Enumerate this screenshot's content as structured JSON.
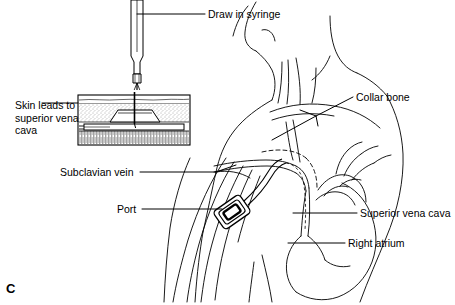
{
  "figure": {
    "panel_label": "C",
    "background_color": "#ffffff",
    "line_color": "#000000"
  },
  "labels": [
    {
      "name": "draw-in-syringe",
      "text": "Draw in syringe",
      "x": 208,
      "y": 8
    },
    {
      "name": "collar-bone",
      "text": "Collar bone",
      "x": 356,
      "y": 91
    },
    {
      "name": "superior-vena-cava",
      "text": "Superior vena cava",
      "x": 360,
      "y": 207
    },
    {
      "name": "right-atrium",
      "text": "Right atrium",
      "x": 348,
      "y": 237
    },
    {
      "name": "subclavian-vein",
      "text": "Subclavian vein",
      "x": 60,
      "y": 166
    },
    {
      "name": "port",
      "text": "Port",
      "x": 117,
      "y": 203
    },
    {
      "name": "skin-leads-to-svc",
      "text": "Skin leads to superior vena cava",
      "x": 15,
      "y": 99
    }
  ],
  "inset": {
    "name": "skin-cross-section",
    "x": 78,
    "y": 95,
    "width": 112,
    "height": 50,
    "layers": [
      "epidermis",
      "subcutaneous-fat",
      "port-reservoir",
      "muscle"
    ]
  },
  "devices": {
    "syringe": {
      "name": "syringe",
      "tip_x": 152,
      "tip_y": 92
    },
    "port": {
      "name": "implanted-port",
      "x": 232,
      "y": 212,
      "rotation_deg": -35
    }
  }
}
